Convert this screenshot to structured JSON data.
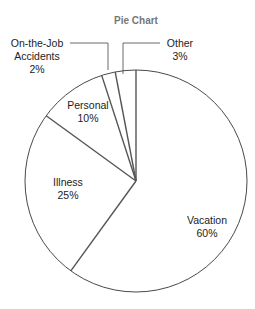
{
  "chart_data": {
    "type": "pie",
    "title": "Pie Chart",
    "categories": [
      "Vacation",
      "Illness",
      "Personal",
      "On-the-Job Accidents",
      "Other"
    ],
    "values": [
      60,
      25,
      10,
      2,
      3
    ],
    "labels": [
      "60%",
      "25%",
      "10%",
      "2%",
      "3%"
    ],
    "start_angle": "top, clockwise",
    "legend": "none (inline labels with leader lines for small slices)"
  },
  "labels": {
    "vacation": {
      "name": "Vacation",
      "pct": "60%"
    },
    "illness": {
      "name": "Illness",
      "pct": "25%"
    },
    "personal": {
      "name": "Personal",
      "pct": "10%"
    },
    "accidents": {
      "name1": "On-the-Job",
      "name2": "Accidents",
      "pct": "2%"
    },
    "other": {
      "name": "Other",
      "pct": "3%"
    }
  },
  "colors": {
    "outline": "#333333",
    "slice_lines": "#555555",
    "fill": "#ffffff",
    "title": "#777777"
  }
}
